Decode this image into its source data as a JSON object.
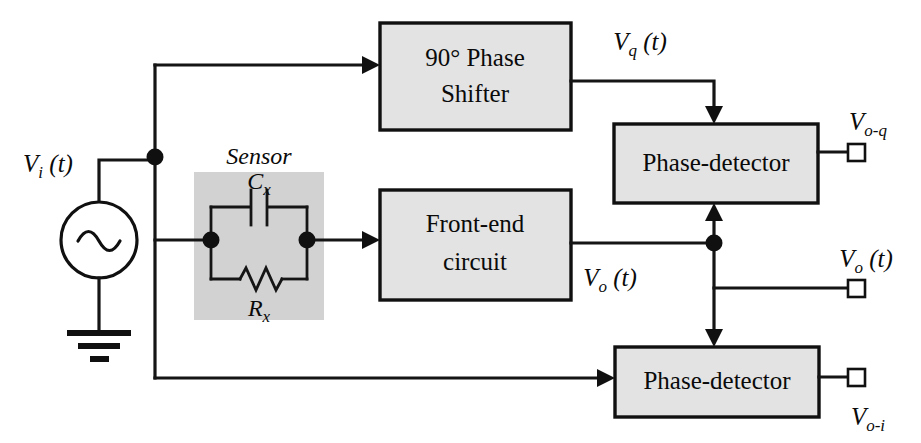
{
  "figure": {
    "type": "block-diagram",
    "background_color": "#ffffff",
    "line_color": "#151515",
    "block_fill": "#e3e3e3",
    "sensor_fill": "#d2d2d2"
  },
  "blocks": [
    {
      "id": "phase-shifter",
      "label_line1": "90° Phase",
      "label_line2": "Shifter",
      "x": 380,
      "y": 23,
      "w": 191,
      "h": 107
    },
    {
      "id": "front-end-circuit",
      "label_line1": "Front-end",
      "label_line2": "circuit",
      "x": 380,
      "y": 190,
      "w": 191,
      "h": 110
    },
    {
      "id": "phase-detector-q",
      "label_line1": "Phase-detector",
      "label_line2": "",
      "x": 614,
      "y": 124,
      "w": 204,
      "h": 79
    },
    {
      "id": "phase-detector-i",
      "label_line1": "Phase-detector",
      "label_line2": "",
      "x": 615,
      "y": 347,
      "w": 204,
      "h": 70
    }
  ],
  "sensor": {
    "title": "Sensor",
    "capacitor_label_base": "C",
    "capacitor_label_sub": "x",
    "resistor_label_base": "R",
    "resistor_label_sub": "x",
    "box": {
      "x": 194,
      "y": 172,
      "w": 130,
      "h": 148
    }
  },
  "source": {
    "label_base": "V",
    "label_sub": "i",
    "label_suffix": " (t)",
    "symbol": "ac-sine-source",
    "ground": "earth-ground"
  },
  "signals": [
    {
      "id": "vq",
      "base": "V",
      "sub": "q",
      "suffix": " (t)",
      "x": 640,
      "y": 50
    },
    {
      "id": "vo",
      "base": "V",
      "sub": "o",
      "suffix": " (t)",
      "x": 610,
      "y": 286
    },
    {
      "id": "voq",
      "base": "V",
      "sub": "o-q",
      "suffix": "",
      "x": 868,
      "y": 130
    },
    {
      "id": "vot",
      "base": "V",
      "sub": "o",
      "suffix": " (t)",
      "x": 866,
      "y": 267
    },
    {
      "id": "voi",
      "base": "V",
      "sub": "o-i",
      "suffix": "",
      "x": 868,
      "y": 425
    }
  ],
  "terminals": [
    {
      "id": "terminal-voq",
      "x": 856,
      "y": 152
    },
    {
      "id": "terminal-vot",
      "x": 856,
      "y": 288
    },
    {
      "id": "terminal-voi",
      "x": 856,
      "y": 377
    }
  ],
  "nodes": [
    {
      "id": "node-input-bus",
      "x": 155,
      "y": 157
    },
    {
      "id": "node-sensor-left",
      "x": 211,
      "y": 240
    },
    {
      "id": "node-sensor-right",
      "x": 307,
      "y": 240
    },
    {
      "id": "node-vo-junction",
      "x": 714,
      "y": 243
    }
  ]
}
